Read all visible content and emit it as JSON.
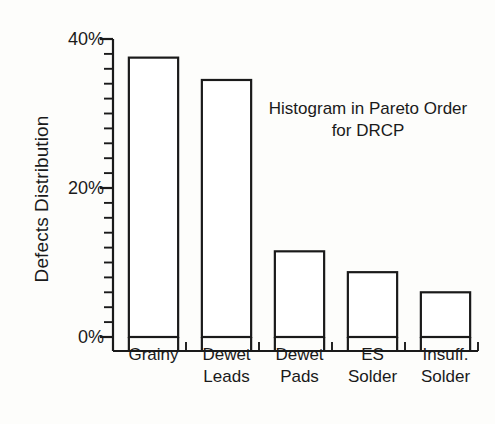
{
  "figure": {
    "background_color": "#fdfdfb",
    "ink_color": "#1a1a1a",
    "bar_fill": "#ffffff"
  },
  "chart_data": {
    "type": "bar",
    "title": "",
    "annotation": "Histogram in Pareto Order for DRCP",
    "annotation_line1": "Histogram in Pareto",
    "annotation_line2": "Order for DRCP",
    "xlabel": "",
    "ylabel": "Defects Distribution",
    "categories": [
      "Grainy",
      "Dewet Leads",
      "Dewet Pads",
      "ES Solder",
      "Insuff. Solder"
    ],
    "category_lines": [
      [
        "Grainy",
        ""
      ],
      [
        "Dewet",
        "Leads"
      ],
      [
        "Dewet",
        "Pads"
      ],
      [
        "ES",
        "Solder"
      ],
      [
        "Insuff.",
        "Solder"
      ]
    ],
    "values": [
      37.5,
      34.5,
      11.5,
      8.7,
      6.0
    ],
    "value_unit": "%",
    "ylim": [
      0,
      40
    ],
    "ytick_values": [
      0,
      20,
      40
    ],
    "ytick_labels": [
      "0%",
      "20%",
      "40%"
    ],
    "yminor_step": 2,
    "grid": false,
    "legend": null,
    "bar_style": "outline"
  },
  "axis_labels": {
    "y_title": "Defects Distribution",
    "ytick_0": "0%",
    "ytick_20": "20%",
    "ytick_40": "40%"
  }
}
